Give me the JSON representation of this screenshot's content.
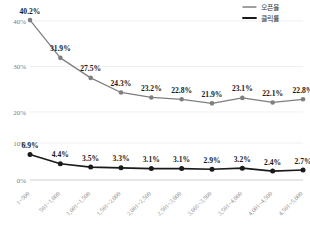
{
  "chart_data": {
    "type": "line",
    "title": "",
    "xlabel": "",
    "ylabel": "",
    "grid": true,
    "legend_position": "top-right",
    "broken_axis": true,
    "categories": [
      "1~500",
      "501~1,000",
      "1,001~1,500",
      "1,501~2,000",
      "2,001~2,500",
      "2,501~3,000",
      "3,001~3,500",
      "3,501~4,000",
      "4,001~4,500",
      "4,501~5,000"
    ],
    "panels": [
      {
        "name": "upper",
        "ylim": [
          20,
          40
        ],
        "yticks": [
          20,
          30,
          40
        ],
        "ytick_labels": [
          "20%",
          "30%",
          "40%"
        ]
      },
      {
        "name": "lower",
        "ylim": [
          0,
          10
        ],
        "yticks": [
          0,
          10
        ],
        "ytick_labels": [
          "0%",
          "10%"
        ]
      }
    ],
    "series": [
      {
        "name": "오픈율",
        "panel": "upper",
        "color": "#7f7f7f",
        "values": [
          40.2,
          31.9,
          27.5,
          24.3,
          23.2,
          22.8,
          21.9,
          23.1,
          22.1,
          22.8
        ],
        "labels": [
          "40.2%",
          "31.9%",
          "27.5%",
          "24.3%",
          "23.2%",
          "22.8%",
          "21.9%",
          "23.1%",
          "22.1%",
          "22.8%"
        ]
      },
      {
        "name": "클릭률",
        "panel": "lower",
        "color": "#1a1a1a",
        "values": [
          6.9,
          4.4,
          3.5,
          3.3,
          3.1,
          3.1,
          2.9,
          3.2,
          2.4,
          2.7
        ],
        "labels": [
          "6.9%",
          "4.4%",
          "3.5%",
          "3.3%",
          "3.1%",
          "3.1%",
          "2.9%",
          "3.2%",
          "2.4%",
          "2.7%"
        ]
      }
    ]
  },
  "legend": {
    "items": [
      {
        "label": "오픈율",
        "color": "#7f7f7f"
      },
      {
        "label": "클릭률",
        "color": "#1a1a1a"
      }
    ]
  }
}
